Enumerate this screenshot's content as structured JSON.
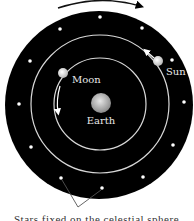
{
  "diagram": {
    "labels": {
      "moon": "Moon",
      "sun": "Sun",
      "earth": "Earth"
    },
    "bodies": [
      {
        "name": "Earth",
        "orbit": "center"
      },
      {
        "name": "Moon",
        "orbit": "inner"
      },
      {
        "name": "Sun",
        "orbit": "outer"
      }
    ],
    "motion": {
      "celestial_sphere": "clockwise",
      "moon": "counterclockwise",
      "sun": "counterclockwise"
    },
    "star_count": 12,
    "caption_cropped": "Stars fixed on the celestial sphere",
    "colors": {
      "sky": "#000000",
      "orbit": "#d8d8d8",
      "star": "#ffffff",
      "earth": "#b0b0b0",
      "background": "#ffffff"
    }
  }
}
